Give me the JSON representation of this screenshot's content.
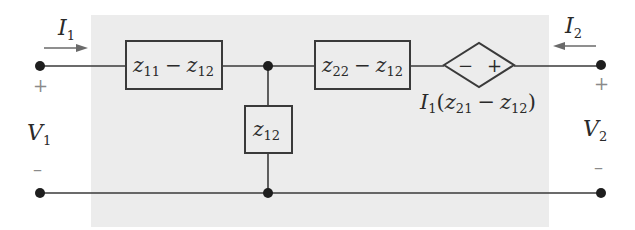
{
  "diagram": {
    "type": "two-port z-parameter equivalent circuit",
    "colors": {
      "shade": "#ececec",
      "wire": "#3a3a3a",
      "node": "#1e1e1e",
      "arrow": "#6a6a6a",
      "sign": "#8a8a8a"
    },
    "port1": {
      "current": {
        "symbol": "I",
        "sub": "1"
      },
      "voltage": {
        "symbol": "V",
        "sub": "1"
      },
      "plus": "+",
      "minus": "–"
    },
    "port2": {
      "current": {
        "symbol": "I",
        "sub": "2"
      },
      "voltage": {
        "symbol": "V",
        "sub": "2"
      },
      "plus": "+",
      "minus": "–"
    },
    "series_left": {
      "a": {
        "symbol": "z",
        "sub": "11"
      },
      "op": "−",
      "b": {
        "symbol": "z",
        "sub": "12"
      }
    },
    "shunt": {
      "symbol": "z",
      "sub": "12"
    },
    "series_right": {
      "a": {
        "symbol": "z",
        "sub": "22"
      },
      "op": "−",
      "b": {
        "symbol": "z",
        "sub": "12"
      }
    },
    "dependent_source": {
      "minus": "−",
      "plus": "+",
      "label": {
        "I": "I",
        "I_sub": "1",
        "open": "(",
        "z1": "z",
        "z1_sub": "21",
        "op": "−",
        "z2": "z",
        "z2_sub": "12",
        "close": ")"
      }
    }
  }
}
